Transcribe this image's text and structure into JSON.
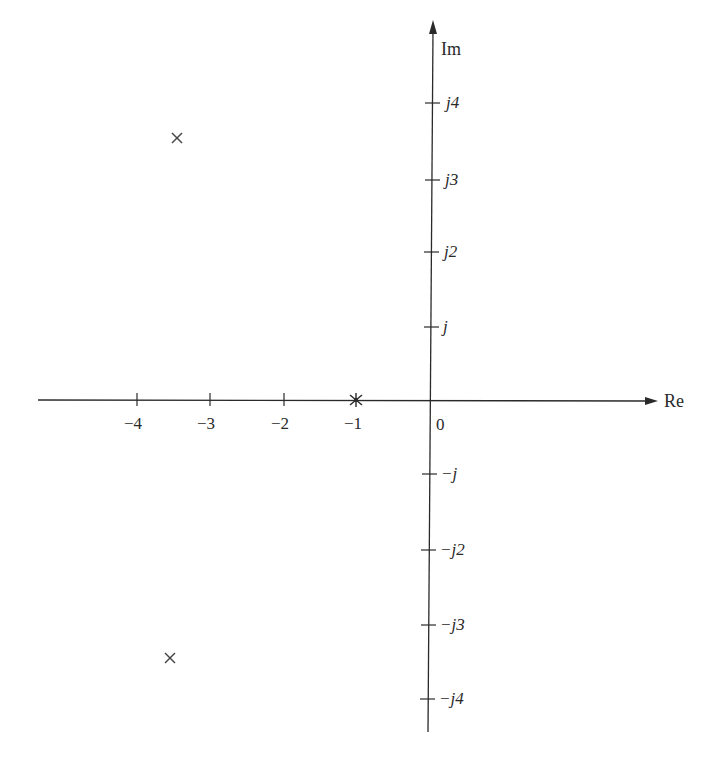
{
  "diagram": {
    "type": "s-plane pole-zero plot",
    "axes": {
      "real_label": "Re",
      "imag_label": "Im",
      "origin_label": "0",
      "real_ticks": [
        {
          "value": -4,
          "label": "−4"
        },
        {
          "value": -3,
          "label": "−3"
        },
        {
          "value": -2,
          "label": "−2"
        },
        {
          "value": -1,
          "label": "−1"
        }
      ],
      "imag_ticks": [
        {
          "value": 4,
          "label": "j4"
        },
        {
          "value": 3,
          "label": "j3"
        },
        {
          "value": 2,
          "label": "j2"
        },
        {
          "value": 1,
          "label": "j"
        },
        {
          "value": -1,
          "label": "−j"
        },
        {
          "value": -2,
          "label": "−j2"
        },
        {
          "value": -3,
          "label": "−j3"
        },
        {
          "value": -4,
          "label": "−j4"
        }
      ]
    },
    "markers": [
      {
        "kind": "pole",
        "symbol": "×",
        "re": -3.5,
        "im": 3.5
      },
      {
        "kind": "pole",
        "symbol": "×",
        "re": -3.5,
        "im": -3.5
      },
      {
        "kind": "asterisk",
        "symbol": "∗",
        "re": -1,
        "im": 0
      }
    ],
    "colors": {
      "ink": "#2a2a2a",
      "background": "#ffffff"
    }
  }
}
